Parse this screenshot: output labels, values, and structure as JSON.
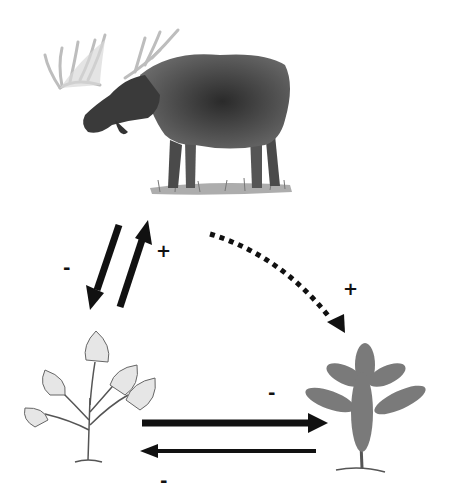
{
  "diagram": {
    "nodes": [
      {
        "id": "moose",
        "label": "Moose",
        "icon": "moose-icon"
      },
      {
        "id": "deciduous",
        "label": "Deciduous sapling (aspen/birch)",
        "icon": "deciduous-sapling-icon"
      },
      {
        "id": "conifer",
        "label": "Conifer seedling (spruce)",
        "icon": "conifer-seedling-icon"
      }
    ],
    "edges": [
      {
        "from": "moose",
        "to": "deciduous",
        "style": "solid",
        "sign": "-"
      },
      {
        "from": "deciduous",
        "to": "moose",
        "style": "solid",
        "sign": "+"
      },
      {
        "from": "moose",
        "to": "conifer",
        "style": "dotted",
        "sign": "+"
      },
      {
        "from": "deciduous",
        "to": "conifer",
        "style": "solid-thick",
        "sign": "-"
      },
      {
        "from": "conifer",
        "to": "deciduous",
        "style": "solid-thin",
        "sign": "-"
      }
    ],
    "signs": {
      "moose_to_deciduous": "-",
      "deciduous_to_moose": "+",
      "moose_to_conifer": "+",
      "deciduous_to_conifer": "-",
      "conifer_to_deciduous": "-"
    },
    "colors": {
      "ink": "#111111",
      "sketch": "#555555",
      "background": "#ffffff"
    }
  }
}
